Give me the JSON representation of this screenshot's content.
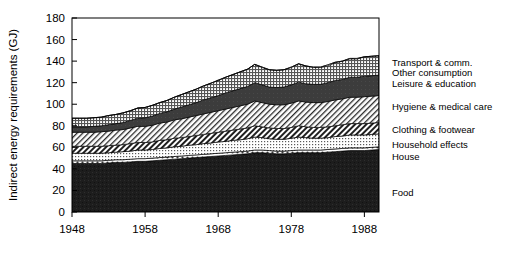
{
  "chart_data": {
    "type": "area",
    "title": "",
    "subtitle": "",
    "xlabel": "",
    "ylabel": "Indirect energy requirements (GJ)",
    "xlim": [
      1948,
      1990
    ],
    "ylim": [
      0,
      180
    ],
    "ytick_labels": [
      "0",
      "20",
      "40",
      "60",
      "80",
      "100",
      "120",
      "140",
      "160",
      "180"
    ],
    "ytick_values": [
      0,
      20,
      40,
      60,
      80,
      100,
      120,
      140,
      160,
      180
    ],
    "xtick_labels": [
      "1948",
      "1958",
      "1968",
      "1978",
      "1988"
    ],
    "xtick_values": [
      1948,
      1958,
      1968,
      1978,
      1988
    ],
    "grid": false,
    "stacked": true,
    "legend_position": "right",
    "x": [
      1948,
      1949,
      1950,
      1951,
      1952,
      1953,
      1954,
      1955,
      1956,
      1957,
      1958,
      1959,
      1960,
      1961,
      1962,
      1963,
      1964,
      1965,
      1966,
      1967,
      1968,
      1969,
      1970,
      1971,
      1972,
      1973,
      1974,
      1975,
      1976,
      1977,
      1978,
      1979,
      1980,
      1981,
      1982,
      1983,
      1984,
      1985,
      1986,
      1987,
      1988,
      1989,
      1990
    ],
    "series": [
      {
        "name": "Food",
        "pattern": "solid-black",
        "color": "#1a1a1a",
        "values": [
          45,
          45,
          45,
          45,
          45,
          45.5,
          46,
          46,
          46.5,
          47,
          47,
          47.5,
          48,
          48.5,
          49,
          49.5,
          50,
          50.5,
          51,
          51.5,
          52,
          52.5,
          53,
          53.5,
          54,
          55,
          55,
          54.5,
          54,
          54,
          54.5,
          55,
          55,
          55,
          55,
          55.5,
          56,
          56.5,
          57,
          57,
          57,
          57.5,
          58
        ]
      },
      {
        "name": "House",
        "pattern": "white-dotted",
        "color": "#ffffff",
        "values": [
          2.5,
          2.5,
          2.5,
          2.5,
          2.5,
          2.5,
          2.5,
          2.5,
          2.5,
          2.5,
          2.5,
          2.5,
          2.5,
          2.5,
          2.5,
          2.5,
          2.5,
          2.5,
          2.5,
          2.5,
          2.5,
          2.5,
          2.5,
          2.5,
          2.5,
          2.5,
          2.5,
          2.5,
          2.5,
          2.5,
          2.5,
          2.5,
          2.5,
          2.5,
          2.5,
          2.5,
          2.5,
          2.5,
          2.5,
          2.5,
          2.5,
          2.5,
          2.5
        ]
      },
      {
        "name": "Household effects",
        "pattern": "light-dots",
        "color": "#d9d9d9",
        "values": [
          7,
          7,
          7,
          7,
          7,
          7,
          7,
          7.5,
          7.5,
          8,
          8,
          8,
          8.5,
          8.5,
          9,
          9,
          9.5,
          9.5,
          10,
          10,
          10.5,
          10.5,
          11,
          11,
          11.5,
          12,
          11.5,
          11,
          11,
          11,
          11.5,
          12,
          11.5,
          11,
          11,
          11,
          11.5,
          11.5,
          12,
          12,
          12,
          12,
          12
        ]
      },
      {
        "name": "Clothing & footwear",
        "pattern": "dark-hatch",
        "color": "#4d4d4d",
        "values": [
          6.5,
          6.5,
          6.5,
          6.5,
          6.5,
          6.5,
          6.5,
          6.5,
          7,
          7,
          7,
          7,
          7.5,
          7.5,
          8,
          8,
          8,
          8.5,
          8.5,
          9,
          9,
          9.5,
          9.5,
          10,
          10,
          10.5,
          10,
          10,
          10,
          10,
          10,
          10.5,
          10,
          10,
          10,
          10,
          10,
          10.5,
          10.5,
          10.5,
          10.5,
          10.5,
          10.5
        ]
      },
      {
        "name": "Hygiene & medical care",
        "pattern": "light-hatch",
        "color": "#e8e8e8",
        "values": [
          13,
          13,
          13,
          13,
          13.5,
          13.5,
          14,
          14,
          14.5,
          15,
          15,
          15.5,
          16,
          16.5,
          17,
          17.5,
          18,
          18.5,
          19,
          19.5,
          20,
          20.5,
          21,
          21.5,
          22,
          23,
          22.5,
          22,
          22,
          22,
          22.5,
          23,
          23,
          23,
          23,
          23.5,
          24,
          24,
          24.5,
          24.5,
          25,
          25,
          25
        ]
      },
      {
        "name": "Leisure & education",
        "pattern": "dark-gray",
        "color": "#3a3a3a",
        "values": [
          5,
          5,
          5,
          5.5,
          5.5,
          6,
          6,
          6.5,
          7,
          7.5,
          8,
          8.5,
          9,
          9.5,
          10,
          11,
          11.5,
          12,
          13,
          13.5,
          14,
          15,
          15.5,
          16,
          16.5,
          17,
          16.5,
          16,
          16,
          16.5,
          17,
          17.5,
          17,
          17,
          17,
          17.5,
          18,
          18,
          18.5,
          18.5,
          19,
          19,
          19
        ]
      },
      {
        "name": "Other consumption",
        "pattern": "fine-grid",
        "color": "#c6c6c6",
        "values": [
          8,
          8,
          8,
          8,
          8,
          8.5,
          8.5,
          9,
          9,
          9.5,
          9.5,
          10,
          10,
          10.5,
          11,
          11.5,
          12,
          12.5,
          13,
          13.5,
          14,
          14.5,
          15,
          15.5,
          16,
          17,
          16.5,
          16,
          16,
          16,
          16.5,
          17,
          16.5,
          16,
          16,
          16.5,
          17,
          17,
          17.5,
          17.5,
          18,
          18,
          18
        ]
      },
      {
        "name": "Transport & comm.",
        "pattern": "diag-hatch",
        "color": "#ffffff",
        "values": [
          0,
          0,
          0,
          0,
          0,
          0,
          0,
          0,
          0,
          0,
          0,
          0,
          0,
          0,
          0,
          0,
          0,
          0,
          0,
          0,
          0,
          0,
          0,
          0,
          0,
          0,
          0,
          0,
          0,
          0,
          0,
          0,
          0,
          0,
          0,
          0,
          0,
          0,
          0,
          0,
          0,
          0,
          0
        ]
      }
    ],
    "totals": [
      87,
      87,
      87,
      87.5,
      88,
      89.5,
      90.5,
      92,
      94,
      96.5,
      97,
      99,
      101.5,
      103.5,
      106.5,
      109,
      111.5,
      114,
      117,
      119.5,
      122.5,
      125,
      127.5,
      130,
      132.5,
      137,
      134,
      132,
      131.5,
      132,
      134,
      137.5,
      135.5,
      134,
      134,
      135.5,
      138.5,
      140,
      142,
      142,
      144,
      144.5,
      145
    ]
  },
  "legend": {
    "items": [
      {
        "label": "Transport & comm."
      },
      {
        "label": "Other consumption"
      },
      {
        "label": "Leisure & education"
      },
      {
        "label": "Hygiene & medical care"
      },
      {
        "label": "Clothing & footwear"
      },
      {
        "label": "Household effects"
      },
      {
        "label": "House"
      },
      {
        "label": "Food"
      }
    ]
  }
}
